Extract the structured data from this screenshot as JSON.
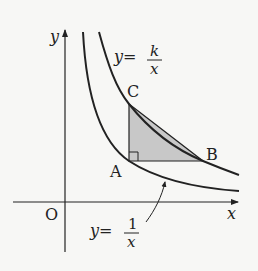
{
  "diagram": {
    "colors": {
      "background": "#f7f7f5",
      "stroke": "#222222",
      "triangle_fill": "#c8c8c8"
    },
    "axes": {
      "x_label": "x",
      "y_label": "y",
      "origin_label": "O"
    },
    "curves": [
      {
        "id": "inner",
        "equation": "y=1/x",
        "lhs": "y=",
        "numerator": "1",
        "denominator": "x"
      },
      {
        "id": "outer",
        "equation": "y=k/x",
        "lhs": "y=",
        "numerator": "k",
        "denominator": "x"
      }
    ],
    "points": {
      "A": {
        "label": "A",
        "on": "y=1/x"
      },
      "B": {
        "label": "B",
        "on": "y=k/x"
      },
      "C": {
        "label": "C",
        "on": "y=k/x"
      }
    },
    "triangle": {
      "vertices": [
        "A",
        "B",
        "C"
      ],
      "right_angle_at": "A",
      "shaded": true
    }
  }
}
